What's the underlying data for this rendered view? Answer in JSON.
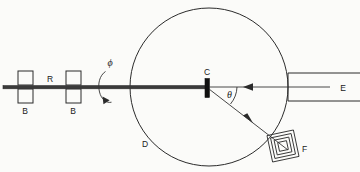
{
  "figure": {
    "background_color": "#fbfbf9",
    "ink_color": "#2b2b2b",
    "width": 360,
    "height": 172
  },
  "labels": {
    "bearing_left": "B",
    "bearing_right": "B",
    "rod": "R",
    "rotation_angle": "ϕ",
    "target": "C",
    "chamber": "D",
    "source": "E",
    "detector": "F",
    "scattering_angle": "θ"
  },
  "components": [
    {
      "id": "B1",
      "name": "bearing-left",
      "label": "B",
      "kind": "paired-squares",
      "x": 26,
      "y": 88
    },
    {
      "id": "R",
      "name": "rotating-rod",
      "label": "R",
      "kind": "horizontal-rod",
      "x1": 3,
      "x2": 300,
      "y": 88
    },
    {
      "id": "B2",
      "name": "bearing-right",
      "label": "B",
      "kind": "paired-squares",
      "x": 74,
      "y": 88
    },
    {
      "id": "phi",
      "name": "rotation-arrow",
      "label": "ϕ",
      "kind": "rotation-arc",
      "x": 110,
      "y": 88
    },
    {
      "id": "D",
      "name": "scattering-chamber",
      "label": "D",
      "kind": "circle",
      "cx": 209,
      "cy": 87,
      "r": 79
    },
    {
      "id": "C",
      "name": "target",
      "label": "C",
      "kind": "filled-rect",
      "x": 206,
      "y": 88
    },
    {
      "id": "E",
      "name": "beam-source",
      "label": "E",
      "kind": "open-rectangle",
      "x": 290,
      "y": 88
    },
    {
      "id": "F",
      "name": "detector",
      "label": "F",
      "kind": "nested-squares",
      "x": 283,
      "y": 146
    }
  ],
  "beams": [
    {
      "name": "incident-beam",
      "from": "E",
      "to": "C",
      "direction": "leftward",
      "arrow": true
    },
    {
      "name": "scattered-beam",
      "from": "C",
      "to": "F",
      "direction": "down-right",
      "arrow": true
    }
  ],
  "angles": [
    {
      "name": "scattering-angle",
      "symbol": "θ",
      "between": [
        "incident-beam",
        "scattered-beam"
      ],
      "vertex": "C"
    },
    {
      "name": "rod-rotation-angle",
      "symbol": "ϕ",
      "about": "R"
    }
  ]
}
